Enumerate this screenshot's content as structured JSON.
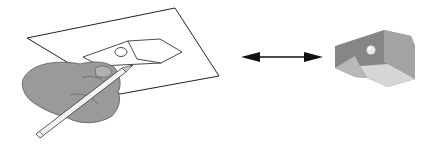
{
  "diagram": {
    "panels": [
      {
        "id": "sketch",
        "label": ""
      },
      {
        "id": "arrow",
        "label": ""
      },
      {
        "id": "model",
        "label": ""
      }
    ],
    "colors": {
      "background": "#ffffff",
      "line": "#222222",
      "hand": "#9a9a9a",
      "model_dark": "#858585",
      "model_mid": "#a8a8a8",
      "model_light": "#d4d4d4"
    }
  }
}
